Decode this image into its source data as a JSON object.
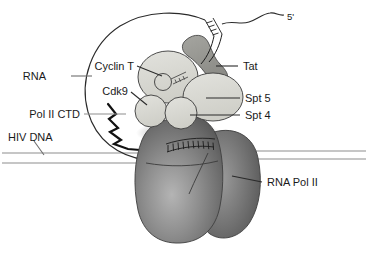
{
  "figure": {
    "name": "HIV Tat transcription elongation complex diagram",
    "background_color": "#ffffff",
    "width": 368,
    "height": 260
  },
  "labels": {
    "rna": "RNA",
    "pol2_ctd": "Pol II CTD",
    "hiv_dna": "HIV DNA",
    "cyclin_t": "Cyclin T",
    "cdk9": "Cdk9",
    "tat": "Tat",
    "spt5": "Spt 5",
    "spt4": "Spt 4",
    "rna_pol2": "RNA Pol II",
    "five_prime": "5'"
  },
  "colors": {
    "outline": "#1a1a1a",
    "line_gray": "#8a8a8a",
    "blob_light": "#d9d9d4",
    "blob_light_2": "#d3d3cc",
    "tat_dark": "#9a9a95",
    "pol2_dark": "#5a5a5a",
    "pol2_mid": "#7d7d7d",
    "pol2_light": "#a8a8a8",
    "text": "#1a1a1a"
  },
  "shapes": {
    "rna_loop": "large open RNA loop arcing from DNA up over the protein complex",
    "ctd_zigzag": "thick black zigzag representing the phosphorylated Pol II CTD tail",
    "tar_stemloop": "hatched ladder segment on RNA bound by Tat",
    "dna_duplex": "two horizontal parallel gray lines crossing the full width",
    "transcription_bubble": "hatched base-pair ladder on top of RNA Pol II",
    "pol2_body": "large shaded gray blob with a cleft notch at its top"
  },
  "elements": [
    {
      "id": "cyclin_t",
      "type": "ellipse",
      "shade": "light"
    },
    {
      "id": "cdk9",
      "type": "circle",
      "shade": "light"
    },
    {
      "id": "spt5",
      "type": "ellipse",
      "shade": "light"
    },
    {
      "id": "spt4",
      "type": "circle",
      "shade": "light"
    },
    {
      "id": "tat",
      "type": "bent-blob",
      "shade": "dark-gray"
    },
    {
      "id": "rna_pol2",
      "type": "large-blob",
      "shade": "gradient-gray"
    }
  ]
}
